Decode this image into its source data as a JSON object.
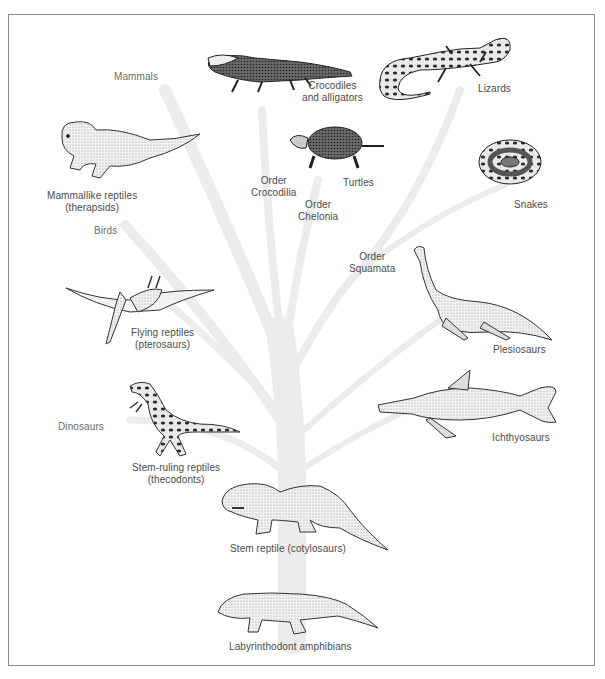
{
  "diagram": {
    "type": "phylogenetic-tree",
    "colors": {
      "frame": "#8a8a8a",
      "tree": "#ececec",
      "text": "#4a4a4a",
      "ink": "#1e1e1e",
      "stipple": "#d8d8d8"
    },
    "branch_labels": {
      "mammals": "Mammals",
      "birds": "Birds",
      "dinosaurs": "Dinosaurs",
      "order_crocodilia": [
        "Order",
        "Crocodilia"
      ],
      "order_chelonia": [
        "Order",
        "Chelonia"
      ],
      "order_squamata": [
        "Order",
        "Squamata"
      ]
    },
    "groups": {
      "crocodiles": [
        "Crocodiles",
        "and alligators"
      ],
      "lizards": [
        "Lizards"
      ],
      "therapsids": [
        "Mammallike reptiles",
        "(therapsids)"
      ],
      "turtles": [
        "Turtles"
      ],
      "snakes": [
        "Snakes"
      ],
      "pterosaurs": [
        "Flying reptiles",
        "(pterosaurs)"
      ],
      "plesiosaurs": [
        "Plesiosaurs"
      ],
      "ichthyosaurs": [
        "Ichthyosaurs"
      ],
      "thecodonts": [
        "Stem-ruling reptiles",
        "(thecodonts)"
      ],
      "cotylosaurs": [
        "Stem reptile (cotylosaurs)"
      ],
      "amphibians": [
        "Labyrinthodont amphibians"
      ]
    }
  }
}
